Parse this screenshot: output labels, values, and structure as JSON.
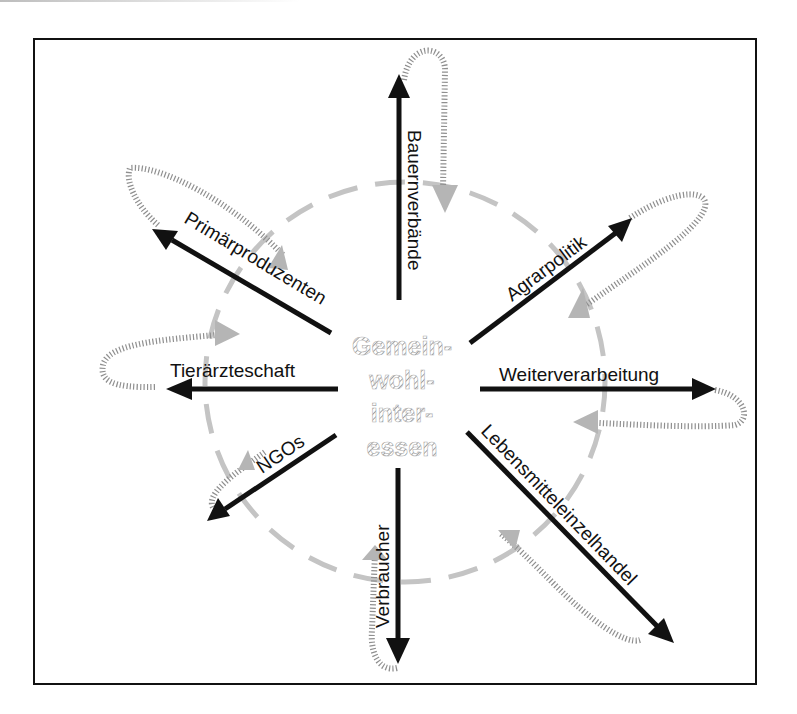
{
  "diagram": {
    "center": {
      "lines": [
        "Gemein-",
        "wohl-",
        "inter-",
        "essen"
      ],
      "meaning": "Gemeinwohlinteressen"
    },
    "circle": {
      "style": "dashed",
      "color": "#c4c4c4"
    },
    "arrow_color": "#111111",
    "feedback_loop_color": "#9a9a9a",
    "actors": [
      {
        "id": "bauernverbaende",
        "label": "Bauernverbände",
        "direction": "up"
      },
      {
        "id": "agrarpolitik",
        "label": "Agrarpolitik",
        "direction": "up-right"
      },
      {
        "id": "weiterverarbeitung",
        "label": "Weiterverarbeitung",
        "direction": "right"
      },
      {
        "id": "lebensmitteleinzelhandel",
        "label": "Lebensmitteleinzelhandel",
        "direction": "down-right"
      },
      {
        "id": "verbraucher",
        "label": "Verbraucher",
        "direction": "down"
      },
      {
        "id": "ngos",
        "label": "NGOs",
        "direction": "down-left"
      },
      {
        "id": "tieraerzteschaft",
        "label": "Tierärzteschaft",
        "direction": "left"
      },
      {
        "id": "primaerproduzenten",
        "label": "Primärproduzenten",
        "direction": "up-left"
      }
    ]
  }
}
